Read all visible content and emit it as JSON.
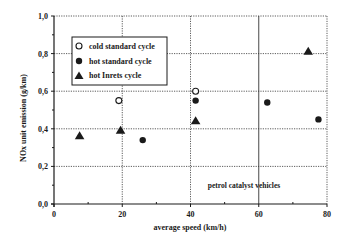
{
  "chart_data": {
    "type": "scatter",
    "title": "",
    "xlabel": "average speed (km/h)",
    "ylabel": "NOx unit emission (g/km)",
    "xlim": [
      0,
      80
    ],
    "ylim": [
      0,
      1.0
    ],
    "x_ticks": [
      0,
      20,
      40,
      60,
      80
    ],
    "x_tick_labels": [
      "0",
      "20",
      "40",
      "60",
      "80"
    ],
    "y_ticks": [
      0,
      0.2,
      0.4,
      0.6,
      0.8,
      1.0
    ],
    "y_tick_labels": [
      "0,0",
      "0,2",
      "0,4",
      "0,6",
      "0,8",
      "1,0"
    ],
    "grid": true,
    "legend_position": "upper left",
    "annotation": "petrol catalyst vehicles",
    "series": [
      {
        "name": "cold standard cycle",
        "marker": "open-circle",
        "points": [
          {
            "x": 19,
            "y": 0.55
          },
          {
            "x": 41.5,
            "y": 0.6
          }
        ]
      },
      {
        "name": "hot standard cycle",
        "marker": "filled-circle",
        "points": [
          {
            "x": 26,
            "y": 0.34
          },
          {
            "x": 41.5,
            "y": 0.55
          },
          {
            "x": 62.5,
            "y": 0.54
          },
          {
            "x": 77.5,
            "y": 0.45
          }
        ]
      },
      {
        "name": "hot Inrets cycle",
        "marker": "filled-triangle",
        "points": [
          {
            "x": 7.5,
            "y": 0.36
          },
          {
            "x": 19.5,
            "y": 0.39
          },
          {
            "x": 41.5,
            "y": 0.44
          },
          {
            "x": 74.5,
            "y": 0.81
          }
        ]
      }
    ]
  },
  "legend": {
    "items": [
      {
        "label": "cold standard cycle"
      },
      {
        "label": "hot standard cycle"
      },
      {
        "label": "hot Inrets cycle"
      }
    ]
  }
}
